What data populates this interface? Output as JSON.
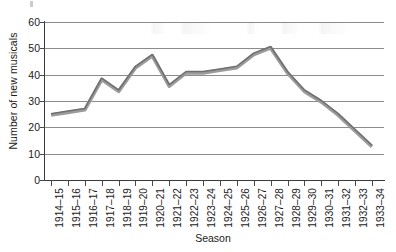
{
  "chart_data": {
    "type": "line",
    "title": "",
    "xlabel": "Season",
    "ylabel": "Number of new musicals",
    "ylim": [
      0,
      60
    ],
    "ytick_labels": [
      "60",
      "50",
      "40",
      "30",
      "20",
      "10",
      "0"
    ],
    "yticks": [
      60,
      50,
      40,
      30,
      20,
      10,
      0
    ],
    "grid": "horizontal",
    "legend": "none",
    "line_color": "#8a8a8a",
    "categories": [
      "1914–15",
      "1915–16",
      "1916–17",
      "1917–18",
      "1918–19",
      "1919–20",
      "1920–21",
      "1921–22",
      "1922–23",
      "1923–24",
      "1924–25",
      "1925–26",
      "1926–27",
      "1927–28",
      "1928–29",
      "1929–30",
      "1930–31",
      "1931–32",
      "1932–33",
      "1933–34"
    ],
    "values": [
      25,
      26,
      27,
      38.5,
      34,
      43,
      47.5,
      36,
      41,
      41,
      42,
      43,
      48,
      50.5,
      41,
      34,
      30,
      25,
      19,
      13
    ]
  }
}
